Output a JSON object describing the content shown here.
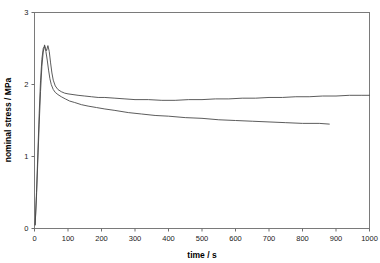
{
  "chart_data": {
    "type": "line",
    "title": "",
    "xlabel": "time / s",
    "ylabel": "nominal stress / MPa",
    "xlim": [
      0,
      1000
    ],
    "ylim": [
      0,
      3
    ],
    "xticks": [
      "0",
      "100",
      "200",
      "300",
      "400",
      "500",
      "600",
      "700",
      "800",
      "900",
      "1000"
    ],
    "yticks": [
      "0",
      "1",
      "2",
      "3"
    ],
    "grid": false,
    "legend": "none",
    "series": [
      {
        "name": "curve-upper-plateau",
        "x": [
          2,
          6,
          10,
          14,
          18,
          22,
          26,
          30,
          33,
          36,
          40,
          44,
          48,
          52,
          56,
          62,
          70,
          80,
          90,
          100,
          115,
          130,
          150,
          170,
          190,
          210,
          240,
          270,
          300,
          340,
          380,
          420,
          460,
          500,
          540,
          580,
          620,
          660,
          700,
          740,
          780,
          820,
          860,
          900,
          940,
          975,
          1000
        ],
        "y": [
          0.05,
          0.45,
          0.95,
          1.45,
          1.9,
          2.25,
          2.45,
          2.55,
          2.5,
          2.47,
          2.54,
          2.46,
          2.3,
          2.16,
          2.06,
          1.98,
          1.93,
          1.9,
          1.88,
          1.87,
          1.86,
          1.85,
          1.84,
          1.83,
          1.82,
          1.82,
          1.81,
          1.8,
          1.79,
          1.79,
          1.78,
          1.78,
          1.79,
          1.79,
          1.8,
          1.8,
          1.81,
          1.81,
          1.82,
          1.82,
          1.83,
          1.83,
          1.84,
          1.84,
          1.85,
          1.85,
          1.85
        ]
      },
      {
        "name": "curve-lower-decaying",
        "x": [
          2,
          6,
          10,
          14,
          18,
          22,
          26,
          30,
          34,
          38,
          42,
          46,
          50,
          56,
          62,
          70,
          80,
          92,
          105,
          120,
          140,
          160,
          185,
          210,
          240,
          280,
          320,
          360,
          400,
          450,
          500,
          550,
          600,
          650,
          700,
          750,
          800,
          850,
          880
        ],
        "y": [
          0.05,
          0.5,
          1.05,
          1.6,
          2.05,
          2.35,
          2.5,
          2.53,
          2.46,
          2.34,
          2.2,
          2.08,
          2.0,
          1.93,
          1.89,
          1.86,
          1.83,
          1.8,
          1.77,
          1.75,
          1.72,
          1.7,
          1.68,
          1.66,
          1.64,
          1.61,
          1.59,
          1.57,
          1.56,
          1.54,
          1.53,
          1.51,
          1.5,
          1.49,
          1.48,
          1.47,
          1.46,
          1.46,
          1.45
        ]
      }
    ]
  }
}
